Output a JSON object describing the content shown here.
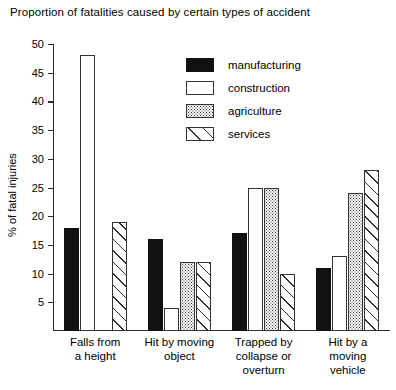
{
  "chart_data": {
    "type": "bar",
    "title": "Proportion of fatalities caused by certain types of accident",
    "xlabel": "",
    "ylabel": "% of fatal injuries",
    "ylim": [
      0,
      50
    ],
    "yticks": [
      5,
      10,
      15,
      20,
      25,
      30,
      35,
      40,
      45,
      50
    ],
    "grid": false,
    "legend_position": "upper-center-right",
    "categories": [
      "Falls from a height",
      "Hit by moving object",
      "Trapped by collapse or overturn",
      "Hit by a moving vehicle"
    ],
    "category_lines": [
      [
        "Falls from",
        "a height"
      ],
      [
        "Hit by moving",
        "object"
      ],
      [
        "Trapped by",
        "collapse or",
        "overturn"
      ],
      [
        "Hit by a",
        "moving",
        "vehicle"
      ]
    ],
    "series": [
      {
        "name": "manufacturing",
        "pattern": "solid-black",
        "values": [
          18,
          16,
          17,
          11
        ]
      },
      {
        "name": "construction",
        "pattern": "open-white",
        "values": [
          48,
          4,
          25,
          13
        ]
      },
      {
        "name": "agriculture",
        "pattern": "dotted",
        "values": [
          0,
          12,
          25,
          24
        ]
      },
      {
        "name": "services",
        "pattern": "diagonal-hatch",
        "values": [
          19,
          12,
          10,
          28
        ]
      }
    ]
  },
  "legend": {
    "items": [
      {
        "label": "manufacturing"
      },
      {
        "label": "construction"
      },
      {
        "label": "agriculture"
      },
      {
        "label": "services"
      }
    ]
  },
  "colors": {
    "axis": "#2b2b2b",
    "ink": "#000000",
    "background": "#ffffff",
    "pattern_ink": "#2f2f2f"
  }
}
